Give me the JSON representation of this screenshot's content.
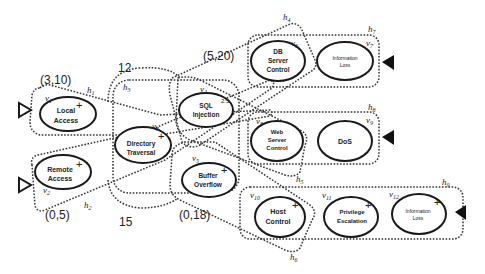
{
  "diagram": {
    "nodes": [
      {
        "id": "v1",
        "label_line1": "Local",
        "label_line2": "Access",
        "vlabel": "v",
        "sub": "1",
        "sign": "+"
      },
      {
        "id": "v2",
        "label_line1": "Remote",
        "label_line2": "Access",
        "vlabel": "v",
        "sub": "2",
        "sign": "+"
      },
      {
        "id": "v3",
        "label_line1": "Directory",
        "label_line2": "Traversal",
        "vlabel": "v",
        "sub": "3",
        "sign": "+"
      },
      {
        "id": "v4",
        "label_line1": "SQL",
        "label_line2": "Injection",
        "vlabel": "v",
        "sub": "4",
        "sign": "2:5"
      },
      {
        "id": "v5",
        "label_line1": "Buffer",
        "label_line2": "Overflow",
        "vlabel": "v",
        "sub": "5",
        "sign": "+"
      },
      {
        "id": "v6",
        "label_line1": "DB",
        "label_line2": "Server",
        "label_line3": "Control",
        "vlabel": "v",
        "sub": "6",
        "sign": ""
      },
      {
        "id": "v7",
        "label_line1": "Information",
        "label_line2": "Loss",
        "vlabel": "v",
        "sub": "7",
        "sign": ""
      },
      {
        "id": "v8",
        "label_line1": "Web",
        "label_line2": "Server",
        "label_line3": "Control",
        "vlabel": "v",
        "sub": "8",
        "sign": ""
      },
      {
        "id": "v9",
        "label_line1": "DoS",
        "vlabel": "v",
        "sub": "9",
        "sign": ""
      },
      {
        "id": "v10",
        "label_line1": "Host",
        "label_line2": "Control",
        "vlabel": "v",
        "sub": "10",
        "sign": "+"
      },
      {
        "id": "v11",
        "label_line1": "Privilege",
        "label_line2": "Escalation",
        "vlabel": "v",
        "sub": "11",
        "sign": "+"
      },
      {
        "id": "v12",
        "label_line1": "Information",
        "label_line2": "Loss",
        "vlabel": "v",
        "sub": "12",
        "sign": "+"
      }
    ],
    "hyperedges": [
      {
        "id": "h1",
        "label": "h",
        "sub": "1"
      },
      {
        "id": "h2",
        "label": "h",
        "sub": "2"
      },
      {
        "id": "h3",
        "label": "h",
        "sub": "3"
      },
      {
        "id": "h4",
        "label": "h",
        "sub": "4"
      },
      {
        "id": "h5",
        "label": "h",
        "sub": "5"
      },
      {
        "id": "h6",
        "label": "h",
        "sub": "6"
      },
      {
        "id": "h7",
        "label": "h",
        "sub": "7"
      },
      {
        "id": "h8",
        "label": "h",
        "sub": "8"
      },
      {
        "id": "h9",
        "label": "h",
        "sub": "9"
      }
    ],
    "annotations": {
      "a1": "(3,10)",
      "a2": "(0,5)",
      "a3": "12",
      "a4": "15",
      "a5": "(5,20)",
      "a6": "(0,18)"
    },
    "colors": {
      "stroke": "#1a1a1a",
      "dashed": "#333333",
      "background": "#ffffff"
    }
  }
}
